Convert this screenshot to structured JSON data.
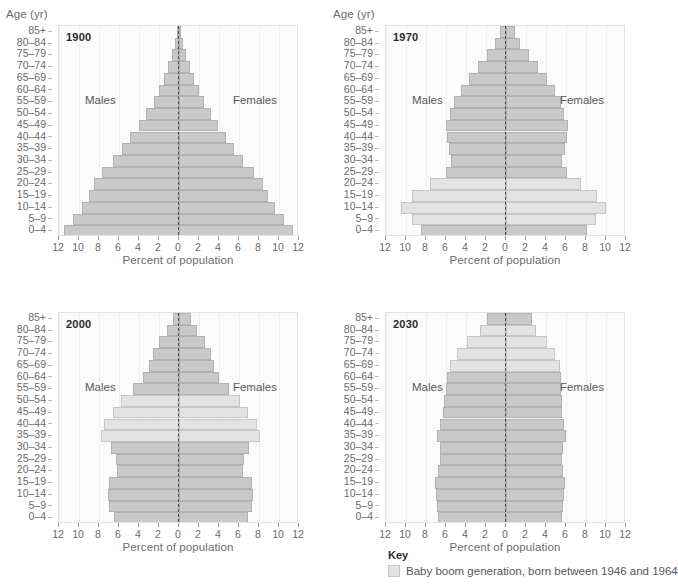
{
  "axis": {
    "y_title": "Age (yr)",
    "x_title": "Percent of population",
    "x_ticks": [
      "12",
      "10",
      "8",
      "6",
      "4",
      "2",
      "0",
      "2",
      "4",
      "6",
      "8",
      "10",
      "12"
    ],
    "x_tick_values": [
      -12,
      -10,
      -8,
      -6,
      -4,
      -2,
      0,
      2,
      4,
      6,
      8,
      10,
      12
    ],
    "xlim": [
      -12,
      12
    ],
    "age_groups": [
      "0–4",
      "5–9",
      "10–14",
      "15–19",
      "20–24",
      "25–29",
      "30–34",
      "35–39",
      "40–44",
      "45–49",
      "50–54",
      "55–59",
      "60–64",
      "65–69",
      "70–74",
      "75–79",
      "80–84",
      "85+"
    ]
  },
  "labels": {
    "males": "Males",
    "females": "Females"
  },
  "key": {
    "title": "Key",
    "entry": "Baby boom generation, born between 1946 and 1964",
    "swatch_color": "#e3e3e3"
  },
  "colors": {
    "bar": "#c9c9c9",
    "bar_border": "#b1b1b1",
    "boom_bar": "#e3e3e3",
    "boom_bar_border": "#c6c6c6",
    "center_line": "#4a4a4a",
    "plot_background": "#fbfbfb",
    "text": "#58585a"
  },
  "chart_data": {
    "type": "bar",
    "xlabel": "Percent of population",
    "ylabel": "Age (yr)",
    "xlim": [
      -12,
      12
    ],
    "grid": true,
    "legend": "Baby boom generation, born between 1946 and 1964",
    "categories": [
      "0–4",
      "5–9",
      "10–14",
      "15–19",
      "20–24",
      "25–29",
      "30–34",
      "35–39",
      "40–44",
      "45–49",
      "50–54",
      "55–59",
      "60–64",
      "65–69",
      "70–74",
      "75–79",
      "80–84",
      "85+"
    ],
    "panels": [
      {
        "year": "1900",
        "boom_groups": [],
        "series": [
          {
            "name": "Males",
            "values": [
              11.5,
              10.6,
              9.7,
              9.0,
              8.5,
              7.7,
              6.6,
              5.7,
              4.9,
              4.0,
              3.3,
              2.5,
              2.0,
              1.5,
              1.1,
              0.7,
              0.4,
              0.2
            ]
          },
          {
            "name": "Females",
            "values": [
              11.4,
              10.5,
              9.6,
              8.9,
              8.4,
              7.5,
              6.4,
              5.5,
              4.7,
              3.9,
              3.2,
              2.5,
              2.0,
              1.5,
              1.1,
              0.7,
              0.4,
              0.2
            ]
          }
        ]
      },
      {
        "year": "1970",
        "boom_groups": [
          "5–9",
          "10–14",
          "15–19",
          "20–24"
        ],
        "series": [
          {
            "name": "Males",
            "values": [
              8.5,
              9.4,
              10.5,
              9.4,
              7.6,
              6.0,
              5.5,
              5.7,
              5.9,
              6.0,
              5.6,
              5.2,
              4.5,
              3.7,
              2.8,
              1.9,
              1.1,
              0.6
            ]
          },
          {
            "name": "Females",
            "values": [
              8.1,
              9.0,
              10.0,
              9.1,
              7.5,
              6.1,
              5.6,
              5.9,
              6.1,
              6.2,
              5.8,
              5.5,
              4.9,
              4.1,
              3.2,
              2.3,
              1.4,
              0.9
            ]
          }
        ]
      },
      {
        "year": "2000",
        "boom_groups": [
          "35–39",
          "40–44",
          "45–49",
          "50–54"
        ],
        "series": [
          {
            "name": "Males",
            "values": [
              6.5,
              7.0,
              7.1,
              7.0,
              6.2,
              6.3,
              6.8,
              7.8,
              7.5,
              6.6,
              5.8,
              4.6,
              3.6,
              3.0,
              2.6,
              2.0,
              1.2,
              0.6
            ]
          },
          {
            "name": "Females",
            "values": [
              6.9,
              7.3,
              7.4,
              7.3,
              6.4,
              6.5,
              7.0,
              8.1,
              7.8,
              6.9,
              6.1,
              5.0,
              4.0,
              3.5,
              3.2,
              2.6,
              1.8,
              1.2
            ]
          }
        ]
      },
      {
        "year": "2030",
        "boom_groups": [
          "65–69",
          "70–74",
          "75–79",
          "80–84"
        ],
        "series": [
          {
            "name": "Males",
            "values": [
              6.8,
              6.9,
              7.0,
              7.1,
              6.8,
              6.6,
              6.6,
              6.9,
              6.6,
              6.3,
              6.2,
              6.0,
              5.9,
              5.6,
              4.9,
              3.9,
              2.6,
              1.9
            ]
          },
          {
            "name": "Females",
            "values": [
              5.6,
              5.7,
              5.8,
              5.9,
              5.7,
              5.6,
              5.7,
              6.0,
              5.8,
              5.6,
              5.6,
              5.5,
              5.5,
              5.4,
              4.9,
              4.1,
              3.0,
              2.6
            ]
          }
        ]
      }
    ]
  }
}
